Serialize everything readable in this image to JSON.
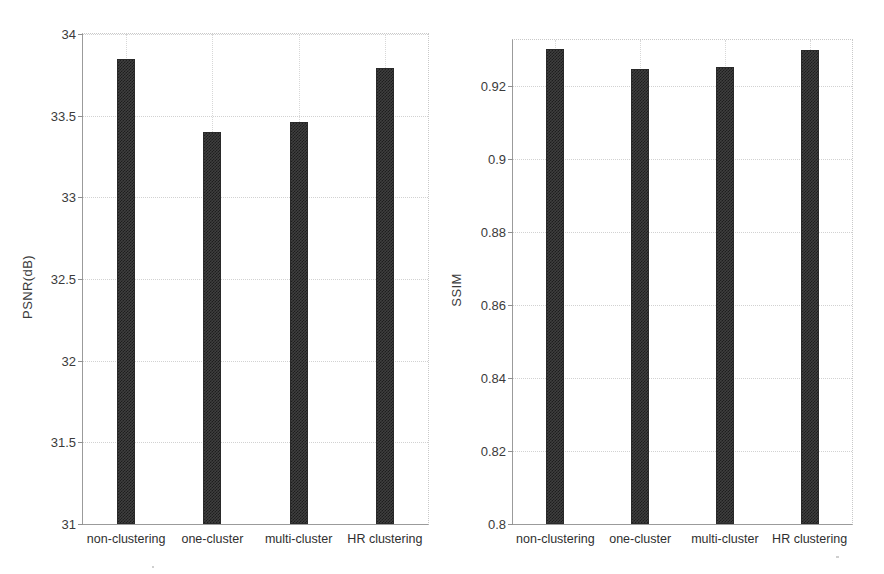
{
  "figure": {
    "background": "#ffffff",
    "bar_color": "#3f3f3f",
    "grid_color": "#d2d2d2",
    "axis_color": "#9b9b9b"
  },
  "panels": [
    {
      "id": "psnr-panel",
      "ylabel": "PSNR(dB)",
      "ytick_labels": [
        "34",
        "33.5",
        "33",
        "32.5",
        "32",
        "31.5",
        "31"
      ],
      "xtick_labels": [
        "non-clustering",
        "one-cluster",
        "multi-cluster",
        "HR clustering"
      ]
    },
    {
      "id": "ssim-panel",
      "ylabel": "SSIM",
      "ytick_labels": [
        "0.92",
        "0.9",
        "0.88",
        "0.86",
        "0.84",
        "0.82",
        "0.8"
      ],
      "xtick_labels": [
        "non-clustering",
        "one-cluster",
        "multi-cluster",
        "HR clustering"
      ]
    }
  ],
  "chart_data": [
    {
      "type": "bar",
      "title": "",
      "xlabel": "",
      "ylabel": "PSNR(dB)",
      "categories": [
        "non-clustering",
        "one-cluster",
        "multi-cluster",
        "HR clustering"
      ],
      "values": [
        33.85,
        33.4,
        33.46,
        33.79
      ],
      "ylim": [
        31,
        34
      ],
      "yticks": [
        31,
        31.5,
        32,
        32.5,
        33,
        33.5,
        34
      ],
      "ytick_labels": [
        "31",
        "31.5",
        "32",
        "32.5",
        "33",
        "33.5",
        "34"
      ],
      "grid": true,
      "legend": "none"
    },
    {
      "type": "bar",
      "title": "",
      "xlabel": "",
      "ylabel": "SSIM",
      "categories": [
        "non-clustering",
        "one-cluster",
        "multi-cluster",
        "HR clustering"
      ],
      "values": [
        0.93,
        0.9246,
        0.9252,
        0.9298
      ],
      "ylim": [
        0.8,
        0.9325
      ],
      "yticks": [
        0.8,
        0.82,
        0.84,
        0.86,
        0.88,
        0.9,
        0.92
      ],
      "ytick_labels": [
        "0.8",
        "0.82",
        "0.84",
        "0.86",
        "0.88",
        "0.9",
        "0.92"
      ],
      "grid": true,
      "legend": "none"
    }
  ]
}
